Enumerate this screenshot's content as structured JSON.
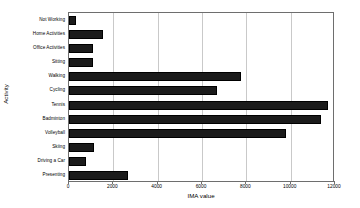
{
  "chart_data": {
    "type": "bar",
    "orientation": "horizontal",
    "title": "",
    "xlabel": "IMA value",
    "ylabel": "Activity",
    "categories": [
      "Not Working",
      "Home Activities",
      "Office Activities",
      "Sitting",
      "Walking",
      "Cycling",
      "Tennis",
      "Badminton",
      "Volleyball",
      "Skiing",
      "Driving a Car",
      "Presenting"
    ],
    "values": [
      320,
      1530,
      1080,
      1080,
      7760,
      6680,
      11700,
      11350,
      9780,
      1130,
      770,
      2660
    ],
    "xlim": [
      0,
      12000
    ],
    "xticks": [
      0,
      2000,
      4000,
      6000,
      8000,
      10000,
      12000
    ],
    "xticklabels": [
      "0",
      "2000",
      "4000",
      "6000",
      "8000",
      "10000",
      "12000"
    ],
    "grid": true,
    "grid_axis": "x",
    "legend": false,
    "bar_color": "#1b1b1b",
    "grid_color": "#c9c9c9",
    "axis_color": "#6e6e6e",
    "background_color": "#ffffff"
  }
}
